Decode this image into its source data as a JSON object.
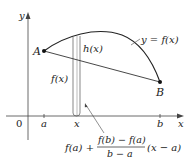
{
  "diagram": {
    "axes": {
      "x_label": "x",
      "y_label": "y",
      "origin_label": "0",
      "ticks": [
        "a",
        "x",
        "b"
      ]
    },
    "points": [
      {
        "label": "A"
      },
      {
        "label": "B"
      }
    ],
    "curve_label": "y = f(x)",
    "strip_labels": {
      "h": "h(x)",
      "f": "f(x)"
    },
    "secant_formula": {
      "prefix": "f(a) +",
      "numerator": "f(b) − f(a)",
      "denominator": "b − a",
      "suffix": "(x − a)"
    },
    "colors": {
      "line": "#222222",
      "background": "#ffffff"
    }
  }
}
